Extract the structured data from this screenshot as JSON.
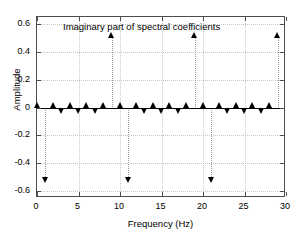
{
  "chart_data": {
    "type": "scatter",
    "title": "Imaginary part of spectral coefficients",
    "xlabel": "Frequency (Hz)",
    "ylabel": "Amplitude",
    "xlim": [
      0,
      30
    ],
    "ylim": [
      -0.65,
      0.65
    ],
    "xticks": [
      0,
      5,
      10,
      15,
      20,
      25,
      30
    ],
    "xticklabels": [
      "0",
      "5",
      "10",
      "15",
      "20",
      "25",
      "30"
    ],
    "yticks": [
      -0.6,
      -0.4,
      -0.2,
      0,
      0.2,
      0.4,
      0.6
    ],
    "yticklabels": [
      "-0.6",
      "-0.4",
      "-0.2",
      "0",
      "0.2",
      "0.4",
      "0.6"
    ],
    "grid": true,
    "legend": "none",
    "marker_style": "triangle",
    "marker_color": "#000000",
    "stem_color": "#9a9a9a",
    "axis_color": "#4d4d4d",
    "zero_line_color": "#000000",
    "x": [
      0,
      1,
      2,
      3,
      4,
      5,
      6,
      7,
      8,
      9,
      10,
      11,
      12,
      13,
      14,
      15,
      16,
      17,
      18,
      19,
      20,
      21,
      22,
      23,
      24,
      25,
      26,
      27,
      28,
      29
    ],
    "values": [
      0,
      -0.5,
      0,
      0,
      0,
      0,
      0,
      0,
      0,
      0.5,
      0,
      -0.5,
      0,
      0,
      0,
      0,
      0,
      0,
      0,
      0.5,
      0,
      -0.5,
      0,
      0,
      0,
      0,
      0,
      0,
      0,
      0.5
    ],
    "peaks_positive": [
      {
        "frequency": 9,
        "amplitude": 0.5
      },
      {
        "frequency": 19,
        "amplitude": 0.5
      },
      {
        "frequency": 29,
        "amplitude": 0.5
      }
    ],
    "peaks_negative": [
      {
        "frequency": 1,
        "amplitude": -0.5
      },
      {
        "frequency": 11,
        "amplitude": -0.5
      },
      {
        "frequency": 21,
        "amplitude": -0.5
      }
    ]
  }
}
